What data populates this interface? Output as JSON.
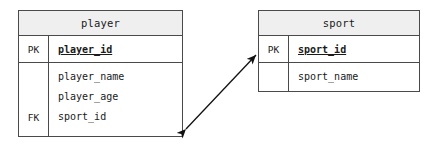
{
  "diagram": {
    "type": "entity-relationship-diagram",
    "background_color": "#ffffff",
    "line_color": "#4a4a4a",
    "header_fill": "#efefef",
    "text_color": "#1a1a1a"
  },
  "entities": [
    {
      "name": "player",
      "title": "player",
      "primary_key": {
        "key_label": "PK",
        "attribute": "player_id"
      },
      "attributes": [
        {
          "key_label": "",
          "name": "player_name"
        },
        {
          "key_label": "",
          "name": "player_age"
        },
        {
          "key_label": "FK",
          "name": "sport_id"
        }
      ]
    },
    {
      "name": "sport",
      "title": "sport",
      "primary_key": {
        "key_label": "PK",
        "attribute": "sport_id"
      },
      "attributes": [
        {
          "key_label": "",
          "name": "sport_name"
        }
      ]
    }
  ],
  "relationship": {
    "from_entity": "player",
    "to_entity": "sport",
    "from_attribute": "sport_id",
    "to_attribute": "sport_id",
    "style": "double-headed-arrow",
    "color": "#111111"
  }
}
